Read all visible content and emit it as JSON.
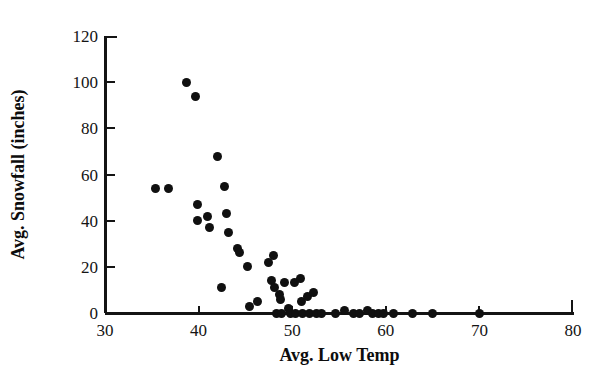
{
  "chart_data": {
    "type": "scatter",
    "title": "",
    "xlabel": "Avg. Low Temp",
    "ylabel": "Avg. Snowfall (inches)",
    "xlim": [
      30,
      80
    ],
    "ylim": [
      0,
      120
    ],
    "xticks": [
      30,
      40,
      50,
      60,
      70,
      80
    ],
    "yticks": [
      0,
      20,
      40,
      60,
      80,
      100,
      120
    ],
    "xtick_labels": [
      "30",
      "40",
      "50",
      "60",
      "70",
      "80"
    ],
    "ytick_labels": [
      "0",
      "20",
      "40",
      "60",
      "80",
      "100",
      "120"
    ],
    "grid": false,
    "legend": null,
    "marker": "filled-circle",
    "marker_color": "#101010",
    "points": [
      {
        "x": 35.4,
        "y": 54
      },
      {
        "x": 36.8,
        "y": 54
      },
      {
        "x": 38.7,
        "y": 100
      },
      {
        "x": 39.7,
        "y": 94
      },
      {
        "x": 39.9,
        "y": 47
      },
      {
        "x": 39.9,
        "y": 40
      },
      {
        "x": 41.0,
        "y": 42
      },
      {
        "x": 41.2,
        "y": 37
      },
      {
        "x": 42.0,
        "y": 68
      },
      {
        "x": 42.4,
        "y": 11
      },
      {
        "x": 42.8,
        "y": 55
      },
      {
        "x": 43.0,
        "y": 43
      },
      {
        "x": 43.2,
        "y": 35
      },
      {
        "x": 44.2,
        "y": 28
      },
      {
        "x": 44.4,
        "y": 26
      },
      {
        "x": 45.2,
        "y": 20
      },
      {
        "x": 45.4,
        "y": 3
      },
      {
        "x": 46.3,
        "y": 5
      },
      {
        "x": 47.5,
        "y": 22
      },
      {
        "x": 47.8,
        "y": 14
      },
      {
        "x": 48.0,
        "y": 25
      },
      {
        "x": 48.1,
        "y": 11
      },
      {
        "x": 48.3,
        "y": 0
      },
      {
        "x": 48.6,
        "y": 8
      },
      {
        "x": 48.7,
        "y": 6
      },
      {
        "x": 48.9,
        "y": 0
      },
      {
        "x": 49.2,
        "y": 13
      },
      {
        "x": 49.6,
        "y": 2
      },
      {
        "x": 49.8,
        "y": 0
      },
      {
        "x": 50.2,
        "y": 13
      },
      {
        "x": 50.4,
        "y": 0
      },
      {
        "x": 50.9,
        "y": 15
      },
      {
        "x": 51.0,
        "y": 5
      },
      {
        "x": 51.1,
        "y": 0
      },
      {
        "x": 51.6,
        "y": 7
      },
      {
        "x": 51.8,
        "y": 0
      },
      {
        "x": 52.3,
        "y": 9
      },
      {
        "x": 52.6,
        "y": 0
      },
      {
        "x": 53.1,
        "y": 0
      },
      {
        "x": 54.6,
        "y": 0
      },
      {
        "x": 55.6,
        "y": 1
      },
      {
        "x": 56.5,
        "y": 0
      },
      {
        "x": 57.2,
        "y": 0
      },
      {
        "x": 58.0,
        "y": 1
      },
      {
        "x": 58.6,
        "y": 0
      },
      {
        "x": 59.2,
        "y": 0
      },
      {
        "x": 59.8,
        "y": 0
      },
      {
        "x": 60.8,
        "y": 0
      },
      {
        "x": 62.8,
        "y": 0
      },
      {
        "x": 65.0,
        "y": 0
      },
      {
        "x": 70.0,
        "y": 0
      }
    ]
  }
}
